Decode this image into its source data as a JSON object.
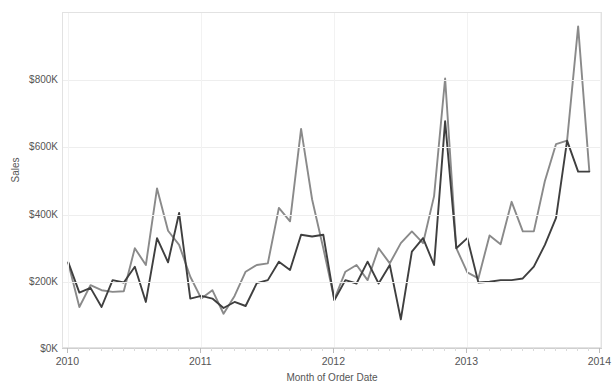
{
  "chart_data": {
    "type": "line",
    "title": "",
    "xlabel": "Month of Order Date",
    "ylabel": "Sales",
    "ylim": [
      0,
      1000000
    ],
    "ytick_values": [
      0,
      200000,
      400000,
      600000,
      800000
    ],
    "ytick_labels": [
      "$0K",
      "$200K",
      "$400K",
      "$600K",
      "$800K"
    ],
    "xtick_labels": [
      "2010",
      "2011",
      "2012",
      "2013",
      "2014"
    ],
    "xtick_values": [
      2010.0,
      2011.0,
      2012.0,
      2013.0,
      2014.0
    ],
    "xlim": [
      2009.96,
      2014.02
    ],
    "grid": "horizontal-and-vertical",
    "legend_position": "none",
    "x": [
      2010.0,
      2010.083,
      2010.167,
      2010.25,
      2010.333,
      2010.417,
      2010.5,
      2010.583,
      2010.667,
      2010.75,
      2010.833,
      2010.917,
      2011.0,
      2011.083,
      2011.167,
      2011.25,
      2011.333,
      2011.417,
      2011.5,
      2011.583,
      2011.667,
      2011.75,
      2011.833,
      2011.917,
      2012.0,
      2012.083,
      2012.167,
      2012.25,
      2012.333,
      2012.417,
      2012.5,
      2012.583,
      2012.667,
      2012.75,
      2012.833,
      2012.917,
      2013.0,
      2013.083,
      2013.167,
      2013.25,
      2013.333,
      2013.417,
      2013.5,
      2013.583,
      2013.667,
      2013.75,
      2013.833,
      2013.917
    ],
    "series": [
      {
        "name": "Sales (light gray line)",
        "color": "#8a8a8a",
        "values": [
          255000,
          125000,
          190000,
          175000,
          170000,
          172000,
          300000,
          250000,
          478000,
          352000,
          310000,
          215000,
          150000,
          175000,
          105000,
          158000,
          230000,
          250000,
          255000,
          420000,
          380000,
          655000,
          445000,
          300000,
          148000,
          230000,
          250000,
          205000,
          300000,
          255000,
          315000,
          350000,
          315000,
          455000,
          805000,
          300000,
          228000,
          210000,
          338000,
          312000,
          438000,
          350000,
          350000,
          500000,
          610000,
          620000,
          960000,
          530000
        ]
      },
      {
        "name": "Sales (dark line)",
        "color": "#3f3f3f",
        "values": [
          258000,
          168000,
          182000,
          125000,
          205000,
          198000,
          245000,
          140000,
          330000,
          258000,
          405000,
          150000,
          158000,
          150000,
          122000,
          140000,
          128000,
          196000,
          205000,
          260000,
          235000,
          340000,
          335000,
          340000,
          145000,
          205000,
          195000,
          260000,
          195000,
          250000,
          88000,
          290000,
          330000,
          250000,
          678000,
          300000,
          330000,
          198000,
          200000,
          205000,
          205000,
          210000,
          245000,
          310000,
          390000,
          620000,
          528000,
          528000
        ]
      }
    ]
  },
  "axes": {
    "y_title": "Sales",
    "x_title": "Month of Order Date"
  },
  "colors": {
    "background": "#ffffff",
    "gridline": "#eeeeee",
    "axis_text": "#555555",
    "series_light": "#8a8a8a",
    "series_dark": "#3f3f3f"
  }
}
